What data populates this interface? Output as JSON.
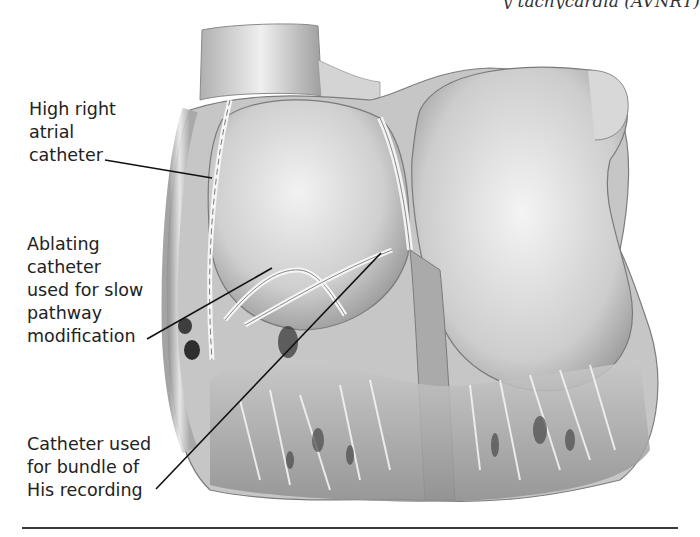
{
  "figure": {
    "clipped_header_fragment": "y tachycardia (AVNRT)",
    "labels": [
      {
        "id": "high-right-atrial-catheter",
        "lines": [
          "High right",
          "atrial",
          "catheter"
        ]
      },
      {
        "id": "ablating-catheter",
        "lines": [
          "Ablating",
          "catheter",
          "used for slow",
          "pathway",
          "modification"
        ]
      },
      {
        "id": "his-bundle-catheter",
        "lines": [
          "Catheter used",
          "for bundle of",
          "His recording"
        ]
      }
    ],
    "colors": {
      "background": "#ffffff",
      "leader_line": "#111111",
      "tissue_light": "#e6e6e6",
      "tissue_mid": "#b8b8b8",
      "tissue_dark": "#6e6e6e"
    }
  }
}
